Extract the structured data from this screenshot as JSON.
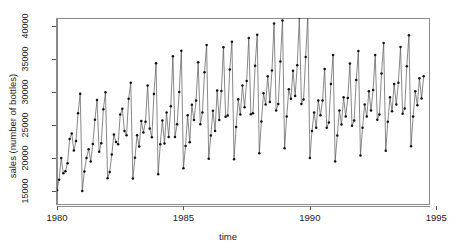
{
  "chart_data": {
    "type": "line",
    "title": "",
    "xlabel": "time",
    "ylabel": "sales (number of bottles)",
    "xlim": [
      1980.0,
      1994.75
    ],
    "ylim": [
      12900,
      41200
    ],
    "xticks": [
      1980,
      1985,
      1990,
      1995
    ],
    "xtick_labels": [
      "1980",
      "1985",
      "1990",
      "1995"
    ],
    "yticks": [
      15000,
      20000,
      25000,
      30000,
      35000,
      40000
    ],
    "ytick_labels": [
      "15000",
      "20000",
      "25000",
      "30000",
      "35000",
      "40000"
    ],
    "grid": false,
    "legend": false,
    "marker": "filled-circle",
    "line_color": "#555555",
    "marker_color": "#111111",
    "frame_color": "#8a8a8a",
    "series": [
      {
        "name": "sales",
        "x": [
          1980.0,
          1980.083,
          1980.167,
          1980.25,
          1980.333,
          1980.417,
          1980.5,
          1980.583,
          1980.667,
          1980.75,
          1980.833,
          1980.917,
          1981.0,
          1981.083,
          1981.167,
          1981.25,
          1981.333,
          1981.417,
          1981.5,
          1981.583,
          1981.667,
          1981.75,
          1981.833,
          1981.917,
          1982.0,
          1982.083,
          1982.167,
          1982.25,
          1982.333,
          1982.417,
          1982.5,
          1982.583,
          1982.667,
          1982.75,
          1982.833,
          1982.917,
          1983.0,
          1983.083,
          1983.167,
          1983.25,
          1983.333,
          1983.417,
          1983.5,
          1983.583,
          1983.667,
          1983.75,
          1983.833,
          1983.917,
          1984.0,
          1984.083,
          1984.167,
          1984.25,
          1984.333,
          1984.417,
          1984.5,
          1984.583,
          1984.667,
          1984.75,
          1984.833,
          1984.917,
          1985.0,
          1985.083,
          1985.167,
          1985.25,
          1985.333,
          1985.417,
          1985.5,
          1985.583,
          1985.667,
          1985.75,
          1985.833,
          1985.917,
          1986.0,
          1986.083,
          1986.167,
          1986.25,
          1986.333,
          1986.417,
          1986.5,
          1986.583,
          1986.667,
          1986.75,
          1986.833,
          1986.917,
          1987.0,
          1987.083,
          1987.167,
          1987.25,
          1987.333,
          1987.417,
          1987.5,
          1987.583,
          1987.667,
          1987.75,
          1987.833,
          1987.917,
          1988.0,
          1988.083,
          1988.167,
          1988.25,
          1988.333,
          1988.417,
          1988.5,
          1988.583,
          1988.667,
          1988.75,
          1988.833,
          1988.917,
          1989.0,
          1989.083,
          1989.167,
          1989.25,
          1989.333,
          1989.417,
          1989.5,
          1989.583,
          1989.667,
          1989.75,
          1989.833,
          1989.917,
          1990.0,
          1990.083,
          1990.167,
          1990.25,
          1990.333,
          1990.417,
          1990.5,
          1990.583,
          1990.667,
          1990.75,
          1990.833,
          1990.917,
          1991.0,
          1991.083,
          1991.167,
          1991.25,
          1991.333,
          1991.417,
          1991.5,
          1991.583,
          1991.667,
          1991.75,
          1991.833,
          1991.917,
          1992.0,
          1992.083,
          1992.167,
          1992.25,
          1992.333,
          1992.417,
          1992.5,
          1992.583,
          1992.667,
          1992.75,
          1992.833,
          1992.917,
          1993.0,
          1993.083,
          1993.167,
          1993.25,
          1993.333,
          1993.417,
          1993.5,
          1993.583,
          1993.667,
          1993.75,
          1993.833,
          1993.917,
          1994.0,
          1994.083,
          1994.167,
          1994.25,
          1994.333,
          1994.417,
          1994.5
        ],
        "values": [
          15136,
          16733,
          20016,
          17708,
          18019,
          19227,
          22893,
          23739,
          21133,
          22591,
          26786,
          29740,
          15028,
          17977,
          20008,
          21354,
          19498,
          22125,
          25817,
          28779,
          20960,
          22254,
          27392,
          29945,
          16933,
          17892,
          20533,
          23569,
          22417,
          22084,
          26580,
          27454,
          24081,
          23451,
          28991,
          31386,
          16896,
          20045,
          23471,
          21747,
          25621,
          23859,
          25500,
          30998,
          24475,
          23145,
          29701,
          34365,
          17556,
          22077,
          25702,
          22214,
          26886,
          23191,
          27831,
          35406,
          23195,
          25110,
          30009,
          36242,
          18450,
          21845,
          26488,
          22394,
          28057,
          25751,
          28705,
          34491,
          25120,
          26908,
          32991,
          37112,
          19888,
          23435,
          27168,
          24108,
          30229,
          25773,
          30154,
          36783,
          26248,
          26436,
          33419,
          37601,
          19818,
          24687,
          28889,
          26590,
          31002,
          27689,
          31679,
          38173,
          26652,
          26798,
          33961,
          38669,
          20730,
          25546,
          29810,
          28128,
          32386,
          28497,
          33244,
          40349,
          27206,
          28182,
          34624,
          40836,
          21476,
          26302,
          30423,
          28992,
          33199,
          29402,
          34042,
          41268,
          28194,
          28857,
          35281,
          41517,
          20000,
          24100,
          26900,
          24600,
          28700,
          26500,
          28700,
          33500,
          24600,
          25400,
          31200,
          35600,
          19500,
          23400,
          27200,
          25100,
          29200,
          26300,
          29100,
          34300,
          24900,
          25700,
          31800,
          36200,
          20400,
          24600,
          28100,
          26300,
          30100,
          27200,
          30300,
          35600,
          25800,
          26600,
          32800,
          37400,
          21100,
          25500,
          29200,
          27100,
          31200,
          28100,
          31400,
          36800,
          26700,
          27500,
          33900,
          38600,
          21800,
          26300,
          30100,
          28000,
          32100,
          29000,
          32400
        ]
      }
    ]
  },
  "axis": {
    "x_title": "time",
    "y_title": "sales (number of bottles)"
  }
}
